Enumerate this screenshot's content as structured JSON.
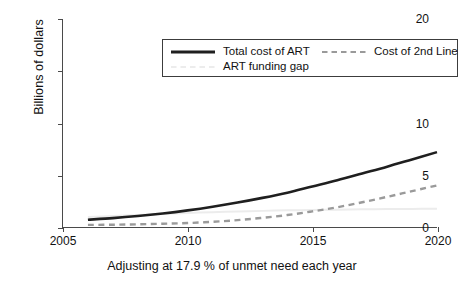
{
  "chart_data": {
    "type": "line",
    "title": "",
    "xlabel": "Adjusting at 17.9 % of unmet need each year",
    "ylabel": "Billions of dollars",
    "xlim": [
      2005,
      2020
    ],
    "ylim": [
      0,
      20
    ],
    "xticks": [
      "2005",
      "2010",
      "2015",
      "2020"
    ],
    "xtick_values": [
      2005,
      2010,
      2015,
      2020
    ],
    "yticks": [
      "0",
      "5",
      "10",
      "15",
      "20"
    ],
    "ytick_values": [
      0,
      5,
      10,
      15,
      20
    ],
    "grid": false,
    "legend_position": "top-left-inside",
    "x": [
      2006,
      2007,
      2008,
      2009,
      2010,
      2011,
      2012,
      2013,
      2014,
      2015,
      2016,
      2017,
      2018,
      2019,
      2020
    ],
    "series": [
      {
        "name": "Total cost of ART",
        "style": "solid",
        "color": "#1f1f1f",
        "width": 2.6,
        "values": [
          0.7,
          0.85,
          1.05,
          1.3,
          1.6,
          1.95,
          2.35,
          2.8,
          3.3,
          3.9,
          4.5,
          5.15,
          5.8,
          6.5,
          7.2
        ]
      },
      {
        "name": "Cost of 2nd Line",
        "style": "dashed",
        "color": "#9a9a9a",
        "width": 2.4,
        "values": [
          0.2,
          0.22,
          0.26,
          0.31,
          0.38,
          0.5,
          0.66,
          0.88,
          1.15,
          1.5,
          1.9,
          2.38,
          2.9,
          3.45,
          4.0
        ]
      },
      {
        "name": "ART funding gap",
        "style": "solid",
        "color": "#ececec",
        "width": 2.0,
        "values": [
          0.95,
          1.05,
          1.15,
          1.25,
          1.35,
          1.42,
          1.5,
          1.55,
          1.6,
          1.64,
          1.67,
          1.7,
          1.72,
          1.74,
          1.75
        ]
      }
    ]
  },
  "legend": {
    "entries": [
      {
        "label": "Total cost of ART",
        "marker": "solid-line-swatch"
      },
      {
        "label": "Cost of 2nd Line",
        "marker": "dashed-line-swatch"
      },
      {
        "label": "ART funding gap",
        "marker": "faint-line-swatch"
      }
    ]
  },
  "axes": {
    "y_title": "Billions of dollars",
    "x_title": "Adjusting at 17.9 % of unmet need each year",
    "y_tick_labels": [
      "0",
      "5",
      "10",
      "15",
      "20"
    ],
    "x_tick_labels": [
      "2005",
      "2010",
      "2015",
      "2020"
    ]
  },
  "colors": {
    "total_cost": "#1f1f1f",
    "second_line": "#9a9a9a",
    "funding_gap": "#ececec",
    "axis": "#4a4a4a",
    "text": "#121212",
    "background": "#ffffff"
  }
}
